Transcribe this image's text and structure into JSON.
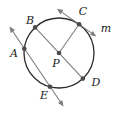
{
  "figure": {
    "type": "geometry-diagram",
    "labels": {
      "A": "A",
      "B": "B",
      "C": "C",
      "D": "D",
      "E": "E",
      "P": "P",
      "m": "m"
    },
    "colors": {
      "background": "#ffffff",
      "circle_stroke": "#2e2e2e",
      "line_stroke": "#7e7e7e",
      "point_fill": "#4a4a4a",
      "label_color": "#1b1b1b"
    },
    "circle": {
      "cx": 59,
      "cy": 53,
      "r": 35
    },
    "points": {
      "A": {
        "x": 24.3,
        "y": 48.7
      },
      "B": {
        "x": 35.1,
        "y": 27.4
      },
      "C": {
        "x": 79.1,
        "y": 24.3
      },
      "D": {
        "x": 82.9,
        "y": 78.6
      },
      "E": {
        "x": 50.0,
        "y": 86.8
      },
      "P": {
        "x": 59,
        "y": 53
      }
    },
    "label_positions": {
      "A": {
        "x": 14,
        "y": 57
      },
      "B": {
        "x": 30,
        "y": 24
      },
      "C": {
        "x": 83,
        "y": 15
      },
      "D": {
        "x": 96,
        "y": 86
      },
      "E": {
        "x": 44,
        "y": 99
      },
      "P": {
        "x": 56,
        "y": 67
      },
      "m": {
        "x": 106,
        "y": 32
      }
    },
    "secant_line": {
      "x1": 11.5,
      "y1": 29.5,
      "x2": 61.5,
      "y2": 103.5
    },
    "tangent_line": {
      "x1": 58.5,
      "y1": 9.9,
      "x2": 94.5,
      "y2": 35.1
    },
    "arrowheads": {
      "secant_upper": "9.5,26.5 10.7,33 15,30.1",
      "secant_lower": "63.5,106.5 58,103 62.3,100.1",
      "tangent_upper": "57,8.8 60.4,14.4 63.4,10.1",
      "tangent_lower": "96.3,36.4 89.9,35.1 92.9,30.9"
    }
  }
}
